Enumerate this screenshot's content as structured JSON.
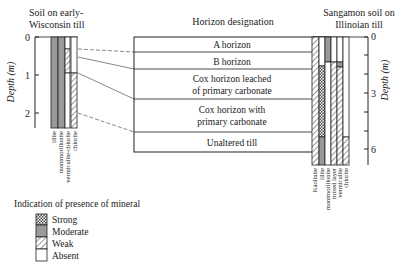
{
  "left_title": [
    "Soil on early-",
    "Wisconsin till"
  ],
  "right_title": [
    "Sangamon soil on",
    "Illinoian till"
  ],
  "center_title": "Horizon designation",
  "horizons": [
    "A horizon",
    "B horizon",
    "Cox horizon leached",
    "of primary carbonate",
    "Cox horizon with",
    "primary carbonate",
    "Unaltered till"
  ],
  "left_axis": {
    "label": "Depth (m)",
    "ticks": [
      "0",
      "1",
      "2"
    ]
  },
  "right_axis": {
    "label": "Depth (m)",
    "ticks": [
      "0",
      "3",
      "6"
    ]
  },
  "left_minerals": [
    "illite",
    "montmorillonite",
    "vermiculite-chlorite",
    "chlorite"
  ],
  "right_minerals": [
    "Kaolinite",
    "illite",
    "montmorillonite",
    "mixed layer",
    "vermiculite",
    "chlorite"
  ],
  "legend": {
    "title": "Indication of presence of mineral",
    "items": [
      "Strong",
      "Moderate",
      "Weak",
      "Absent"
    ]
  }
}
